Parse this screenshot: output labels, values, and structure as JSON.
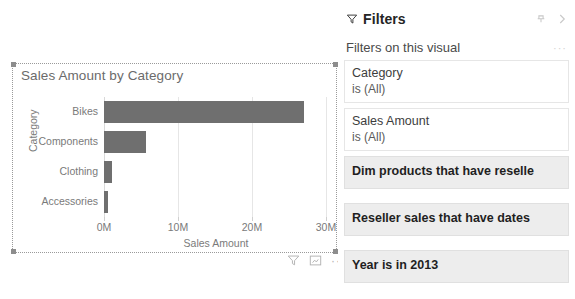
{
  "visual": {
    "title": "Sales Amount by Category",
    "actions": [
      {
        "name": "filter-icon",
        "label": "Filters"
      },
      {
        "name": "focus-mode-icon",
        "label": "Focus mode"
      },
      {
        "name": "more-options-icon",
        "label": "..."
      }
    ]
  },
  "chart_data": {
    "type": "bar",
    "orientation": "horizontal",
    "title": "Sales Amount by Category",
    "xlabel": "Sales Amount",
    "ylabel": "Category",
    "categories": [
      "Bikes",
      "Components",
      "Clothing",
      "Accessories"
    ],
    "values": [
      27000000,
      5700000,
      1100000,
      550000
    ],
    "xlim": [
      0,
      30000000
    ],
    "xticks": [
      0,
      10000000,
      20000000,
      30000000
    ],
    "xticklabels": [
      "0M",
      "10M",
      "20M",
      "30M"
    ],
    "grid": true,
    "legend": false,
    "bar_color": "#6f6f6f"
  },
  "filters": {
    "title": "Filters",
    "pin_label": "Pin",
    "collapse_label": "Collapse filter pane",
    "section_label": "Filters on this visual",
    "section_more": "···",
    "cards": [
      {
        "field": "Category",
        "condition": "is (All)",
        "shaded": false
      },
      {
        "field": "Sales Amount",
        "condition": "is (All)",
        "shaded": false
      },
      {
        "field": "Dim products that have reselle",
        "condition": "",
        "shaded": true
      },
      {
        "field": "Reseller sales that have dates",
        "condition": "",
        "shaded": true
      },
      {
        "field": "Year is in 2013",
        "condition": "",
        "shaded": true
      }
    ]
  }
}
